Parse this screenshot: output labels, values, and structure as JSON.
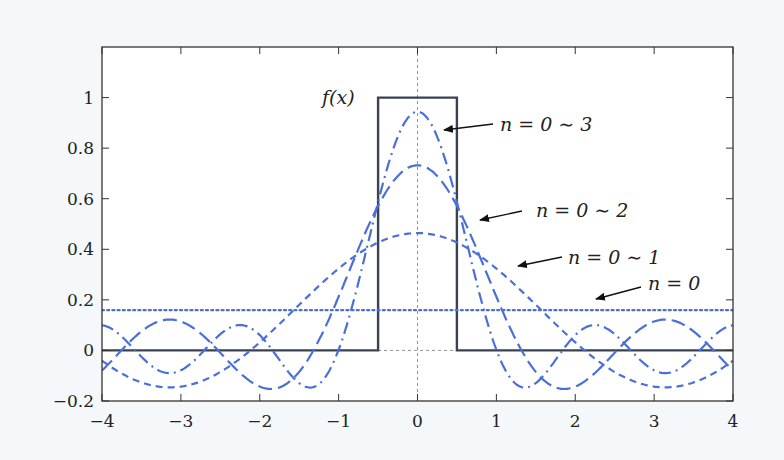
{
  "chart_data": {
    "type": "line",
    "title": "",
    "xlabel": "",
    "ylabel": "",
    "xlim": [
      -4,
      4
    ],
    "ylim": [
      -0.2,
      1.2
    ],
    "grid": false,
    "x_ticks": [
      -4,
      -3,
      -2,
      -1,
      0,
      1,
      2,
      3,
      4
    ],
    "x_tick_labels": [
      "−4",
      "−3",
      "−2",
      "−1",
      "0",
      "1",
      "2",
      "3",
      "4"
    ],
    "y_ticks": [
      -0.2,
      0,
      0.2,
      0.4,
      0.6,
      0.8,
      1
    ],
    "y_tick_labels": [
      "−0.2",
      "0",
      "0.2",
      "0.4",
      "0.6",
      "0.8",
      "1"
    ],
    "reference_lines": [
      {
        "orientation": "vertical",
        "at": 0,
        "style": "dashed",
        "color": "#777777"
      },
      {
        "orientation": "horizontal",
        "at": 0,
        "style": "dashed",
        "color": "#777777"
      }
    ],
    "series": [
      {
        "name": "f(x)",
        "style": "solid",
        "color": "#3a4252",
        "description": "rectangular pulse: 1 for |x|<0.5, else 0",
        "x": [
          -4,
          -0.5,
          -0.5,
          0.5,
          0.5,
          4
        ],
        "values": [
          0,
          0,
          1,
          1,
          0,
          0
        ]
      },
      {
        "name": "n = 0",
        "style": "dotted",
        "color": "#4a6fd8",
        "a0": 0.159,
        "harmonics": [],
        "peak": 0.159
      },
      {
        "name": "n = 0 ~ 1",
        "style": "dashed",
        "color": "#4a6fd8",
        "a0": 0.159,
        "harmonics": [
          0.305
        ],
        "peak": 0.464
      },
      {
        "name": "n = 0 ~ 2",
        "style": "long-dash",
        "color": "#4a6fd8",
        "a0": 0.159,
        "harmonics": [
          0.305,
          0.268
        ],
        "peak": 0.732
      },
      {
        "name": "n = 0 ~ 3",
        "style": "dash-dot",
        "color": "#4a6fd8",
        "a0": 0.159,
        "harmonics": [
          0.305,
          0.268,
          0.212
        ],
        "peak": 0.944
      }
    ],
    "annotations": [
      {
        "text": "f(x)",
        "x": -0.95,
        "y": 1.0
      },
      {
        "text": "n = 0 ~ 3",
        "x": 2.05,
        "y": 0.9,
        "arrow_to": [
          0.3,
          0.87
        ]
      },
      {
        "text": "n = 0 ~ 2",
        "x": 2.35,
        "y": 0.58,
        "arrow_to": [
          0.8,
          0.53
        ]
      },
      {
        "text": "n = 0 ~ 1",
        "x": 2.9,
        "y": 0.38,
        "arrow_to": [
          1.25,
          0.34
        ]
      },
      {
        "text": "n = 0",
        "x": 3.3,
        "y": 0.23,
        "arrow_to": [
          1.6,
          0.18
        ]
      }
    ]
  },
  "labels": {
    "fx": "f(x)",
    "n3": "n = 0 ∼ 3",
    "n2": "n = 0 ∼ 2",
    "n1": "n = 0 ∼ 1",
    "n0": "n = 0"
  }
}
